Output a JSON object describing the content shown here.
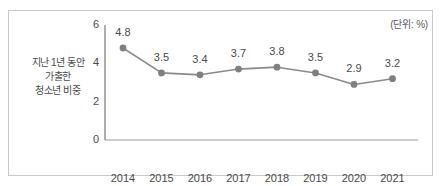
{
  "unit_note": "(단위: %)",
  "series_label_lines": [
    "지난 1년 동안",
    "가출한",
    "청소년 비중"
  ],
  "colors": {
    "line": "#8a8a8a",
    "marker": "#7f7f7f",
    "axis": "#9a9a9a",
    "frame": "#c9c9c9",
    "text": "#4a4a4a"
  },
  "chart_data": {
    "type": "line",
    "title": "",
    "subtitle": "",
    "xlabel": "",
    "ylabel": "",
    "unit": "%",
    "categories": [
      "2014",
      "2015",
      "2016",
      "2017",
      "2018",
      "2019",
      "2020",
      "2021"
    ],
    "series": [
      {
        "name": "지난 1년 동안 가출한 청소년 비중",
        "values": [
          4.8,
          3.5,
          3.4,
          3.7,
          3.8,
          3.5,
          2.9,
          3.2
        ],
        "labels": [
          "4.8",
          "3.5",
          "3.4",
          "3.7",
          "3.8",
          "3.5",
          "2.9",
          "3.2"
        ]
      }
    ],
    "ylim": [
      0,
      6
    ],
    "yticks": [
      0,
      2,
      4,
      6
    ],
    "ytick_labels": [
      "0",
      "2",
      "4",
      "6"
    ],
    "grid": false,
    "legend": "none",
    "markers": true,
    "data_labels": true
  }
}
